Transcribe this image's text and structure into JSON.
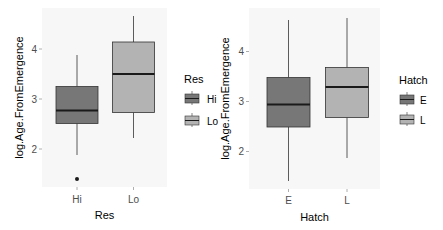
{
  "chart_data": [
    {
      "type": "boxplot",
      "xlabel": "Res",
      "ylabel": "log.Age.FromEmergence",
      "categories": [
        "Hi",
        "Lo"
      ],
      "yticks": [
        2,
        3,
        4
      ],
      "ylim": [
        1.24,
        4.82
      ],
      "grid": false,
      "legend": {
        "title": "Res",
        "position": "right",
        "entries": [
          "Hi",
          "Lo"
        ]
      },
      "boxes": [
        {
          "category": "Hi",
          "whisker_low": 1.88,
          "q1": 2.51,
          "median": 2.77,
          "q3": 3.25,
          "whisker_high": 3.88,
          "outliers": [
            1.4
          ],
          "fill": "#777777"
        },
        {
          "category": "Lo",
          "whisker_low": 2.22,
          "q1": 2.73,
          "median": 3.5,
          "q3": 4.14,
          "whisker_high": 4.66,
          "outliers": [],
          "fill": "#b3b3b3"
        }
      ]
    },
    {
      "type": "boxplot",
      "xlabel": "Hatch",
      "ylabel": "log.Age.FromEmergence",
      "categories": [
        "E",
        "L"
      ],
      "yticks": [
        2,
        3,
        4
      ],
      "ylim": [
        1.25,
        4.87
      ],
      "grid": false,
      "legend": {
        "title": "Hatch",
        "position": "right",
        "entries": [
          "E",
          "L"
        ]
      },
      "boxes": [
        {
          "category": "E",
          "whisker_low": 1.41,
          "q1": 2.49,
          "median": 2.94,
          "q3": 3.48,
          "whisker_high": 4.63,
          "outliers": [],
          "fill": "#777777"
        },
        {
          "category": "L",
          "whisker_low": 1.87,
          "q1": 2.68,
          "median": 3.29,
          "q3": 3.68,
          "whisker_high": 4.67,
          "outliers": [],
          "fill": "#b3b3b3"
        }
      ]
    }
  ],
  "colors": {
    "panel_bg": "#f7f7f7",
    "box_outline": "#333333",
    "median_line": "#1a1a1a",
    "tick_text": "#4d4d4d"
  }
}
